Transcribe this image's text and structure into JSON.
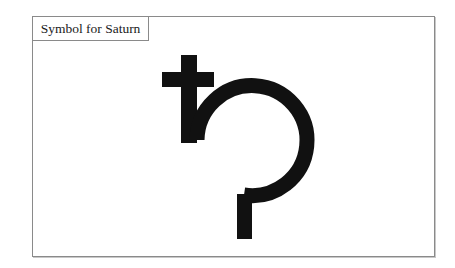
{
  "label": {
    "title": "Symbol for Saturn"
  },
  "symbol": {
    "name": "saturn-symbol",
    "color": "#111111"
  },
  "colors": {
    "background": "#ffffff",
    "border": "#8a8a8a",
    "ink": "#111111"
  }
}
